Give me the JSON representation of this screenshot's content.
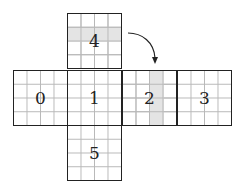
{
  "diagram": {
    "type": "cube-net",
    "grid_per_face": "4x4",
    "faces": [
      {
        "id": "0",
        "label": "0",
        "position": "left"
      },
      {
        "id": "1",
        "label": "1",
        "position": "center"
      },
      {
        "id": "2",
        "label": "2",
        "position": "right",
        "shaded": "column 3"
      },
      {
        "id": "3",
        "label": "3",
        "position": "far-right"
      },
      {
        "id": "4",
        "label": "4",
        "position": "top",
        "shaded": "row 2"
      },
      {
        "id": "5",
        "label": "5",
        "position": "bottom"
      }
    ],
    "arrow": {
      "from": "4",
      "to": "2",
      "style": "curved"
    },
    "colors": {
      "border": "#222222",
      "gridline": "#b8b8b8",
      "shade": "#e4e4e4"
    }
  }
}
